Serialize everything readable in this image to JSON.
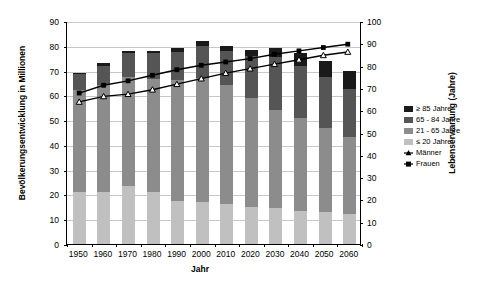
{
  "chart_data": {
    "type": "bar",
    "title": "",
    "xlabel": "Jahr",
    "ylabel": "Bevölkerungsentwicklung in Millionen",
    "y2label": "Lebenserwartung (Jahre)",
    "categories": [
      "1950",
      "1960",
      "1970",
      "1980",
      "1990",
      "2000",
      "2010",
      "2020",
      "2030",
      "2040",
      "2050",
      "2060"
    ],
    "ylim": [
      0,
      90
    ],
    "yticks": [
      "0",
      "10",
      "20",
      "30",
      "40",
      "50",
      "60",
      "70",
      "80",
      "90"
    ],
    "y2lim": [
      0,
      100
    ],
    "y2ticks": [
      "0",
      "10",
      "20",
      "30",
      "40",
      "50",
      "60",
      "70",
      "80",
      "90",
      "100"
    ],
    "grid": true,
    "legend_position": "right",
    "stacked": true,
    "series": [
      {
        "name": "≤ 20 Jahre",
        "color": "#c0c0c0",
        "axis": "left",
        "values": [
          21.0,
          21.0,
          23.5,
          21.0,
          17.5,
          17.0,
          16.0,
          15.0,
          14.5,
          13.5,
          13.0,
          12.0
        ]
      },
      {
        "name": "21 - 65 Jahre",
        "color": "#8c8c8c",
        "axis": "left",
        "values": [
          41.0,
          43.0,
          44.0,
          45.5,
          48.5,
          50.0,
          48.0,
          44.0,
          39.5,
          37.5,
          34.0,
          31.0
        ]
      },
      {
        "name": "65 - 84 Jahre",
        "color": "#555555",
        "axis": "left",
        "values": [
          6.5,
          8.0,
          9.5,
          10.5,
          11.5,
          13.0,
          14.0,
          17.0,
          21.5,
          21.0,
          20.5,
          19.5
        ]
      },
      {
        "name": "≥ 85 Jahre",
        "color": "#1a1a1a",
        "axis": "left",
        "values": [
          0.5,
          1.0,
          1.0,
          1.0,
          1.5,
          2.0,
          2.0,
          2.5,
          3.5,
          5.0,
          6.5,
          7.5
        ]
      },
      {
        "name": "Männer",
        "color": "#000000",
        "axis": "right",
        "marker": "triangle",
        "values": [
          64.0,
          66.5,
          67.5,
          69.5,
          72.0,
          74.5,
          77.0,
          79.0,
          81.0,
          83.0,
          85.0,
          86.5
        ]
      },
      {
        "name": "Frauen",
        "color": "#000000",
        "axis": "right",
        "marker": "square",
        "values": [
          68.0,
          71.5,
          73.5,
          76.0,
          78.5,
          80.5,
          82.0,
          83.5,
          85.5,
          87.0,
          88.5,
          90.0
        ]
      }
    ]
  },
  "legend": {
    "items": [
      {
        "label": "≥ 85 Jahre",
        "type": "swatch",
        "color": "#1a1a1a"
      },
      {
        "label": "65 - 84 Jahre",
        "type": "swatch",
        "color": "#555555"
      },
      {
        "label": "21 - 65 Jahre",
        "type": "swatch",
        "color": "#8c8c8c"
      },
      {
        "label": "≤ 20 Jahre",
        "type": "swatch",
        "color": "#c0c0c0"
      },
      {
        "label": "Männer",
        "type": "marker",
        "marker": "triangle",
        "color": "#000000"
      },
      {
        "label": "Frauen",
        "type": "marker",
        "marker": "square",
        "color": "#000000"
      }
    ]
  }
}
